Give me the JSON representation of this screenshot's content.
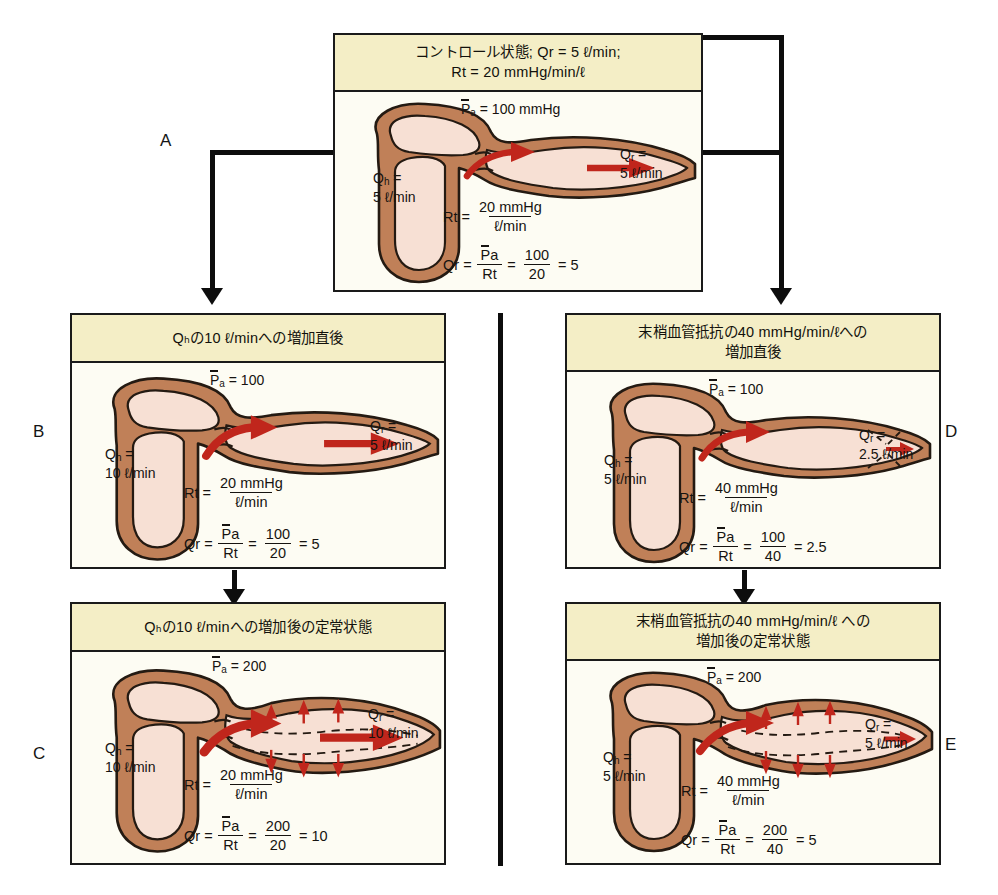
{
  "figure": {
    "units": {
      "flow": "ℓ/min",
      "pressure": "mmHg",
      "resistance": "mmHg/min/ℓ"
    },
    "colors": {
      "header_bg": "#f4eec6",
      "body_bg": "#fdfcf3",
      "border": "#1a1a1a",
      "vessel_wall": "#c08058",
      "vessel_lumen": "#f7e0d4",
      "flow_arrow": "#c0261c",
      "connector": "#0d0d0d"
    }
  },
  "symbols": {
    "Q_r": "Q",
    "Q_r_sub": "r",
    "Q_h": "Q",
    "Q_h_sub": "h",
    "R_t": "R",
    "R_t_sub": "t",
    "P_a": "P",
    "P_a_sub": "a",
    "equals": "=",
    "liter_min": "ℓ/min",
    "mmHg": "mmHg"
  },
  "panels": [
    {
      "id": "A",
      "letter": "A",
      "header": "コントロール状態; Qᵣ = 5 ℓ/min; Rₜ = 20 mmHg/min/ℓ",
      "header_line1": "コントロール状態; Qr = 5 ℓ/min;",
      "header_line2": "Rt = 20 mmHg/min/ℓ",
      "pressure_label": "= 100 mmHg",
      "pressure_value": 100,
      "pressure_units": "mmHg",
      "qh_value": "5 ℓ/min",
      "qh_number": 5,
      "qr_value": "5 ℓ/min",
      "qr_number": 5,
      "resistance_num": "20 mmHg",
      "resistance_den": "ℓ/min",
      "resistance_value": 20,
      "calc_num": "100",
      "calc_den": "20",
      "calc_result": "= 5",
      "dilated": false,
      "constricted": false
    },
    {
      "id": "B",
      "letter": "B",
      "header_line1": "Qₕの10 ℓ/minへの増加直後",
      "header_line2": "",
      "pressure_label": "= 100",
      "pressure_value": 100,
      "pressure_units": "",
      "qh_value": "10 ℓ/min",
      "qh_number": 10,
      "qr_value": "5 ℓ/min",
      "qr_number": 5,
      "resistance_num": "20 mmHg",
      "resistance_den": "ℓ/min",
      "resistance_value": 20,
      "calc_num": "100",
      "calc_den": "20",
      "calc_result": "= 5",
      "dilated": false,
      "constricted": false
    },
    {
      "id": "C",
      "letter": "C",
      "header_line1": "Qₕの10 ℓ/minへの増加後の定常状態",
      "header_line2": "",
      "pressure_label": "= 200",
      "pressure_value": 200,
      "pressure_units": "",
      "qh_value": "10 ℓ/min",
      "qh_number": 10,
      "qr_value": "10 ℓ/min",
      "qr_number": 10,
      "resistance_num": "20 mmHg",
      "resistance_den": "ℓ/min",
      "resistance_value": 20,
      "calc_num": "200",
      "calc_den": "20",
      "calc_result": "= 10",
      "dilated": true,
      "constricted": false
    },
    {
      "id": "D",
      "letter": "D",
      "header_line1": "末梢血管抵抗の40 mmHg/min/ℓへの",
      "header_line2": "増加直後",
      "pressure_label": "= 100",
      "pressure_value": 100,
      "pressure_units": "",
      "qh_value": "5 ℓ/min",
      "qh_number": 5,
      "qr_value": "2.5 ℓ/min",
      "qr_number": 2.5,
      "resistance_num": "40 mmHg",
      "resistance_den": "ℓ/min",
      "resistance_value": 40,
      "calc_num": "100",
      "calc_den": "40",
      "calc_result": "= 2.5",
      "dilated": false,
      "constricted": true
    },
    {
      "id": "E",
      "letter": "E",
      "header_line1": "末梢血管抵抗の40 mmHg/min/ℓ への",
      "header_line2": "増加後の定常状態",
      "pressure_label": "= 200",
      "pressure_value": 200,
      "pressure_units": "",
      "qh_value": "5 ℓ/min",
      "qh_number": 5,
      "qr_value": "5 ℓ/min",
      "qr_number": 5,
      "resistance_num": "40 mmHg",
      "resistance_den": "ℓ/min",
      "resistance_value": 40,
      "calc_num": "200",
      "calc_den": "40",
      "calc_result": "= 5",
      "dilated": true,
      "constricted": true
    }
  ]
}
